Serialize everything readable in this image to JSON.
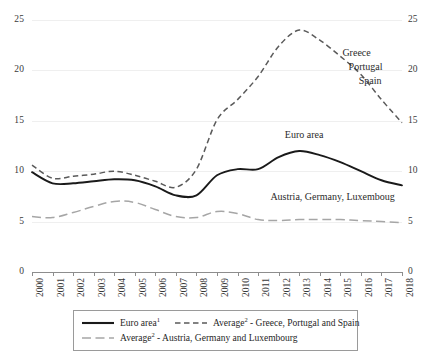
{
  "chart_data": {
    "type": "line",
    "title": "",
    "subtitle": "",
    "xlabel": "",
    "ylabel": "",
    "xlim": [
      2000,
      2018
    ],
    "ylim": [
      0,
      25
    ],
    "yticks": [
      0,
      5,
      10,
      15,
      20,
      25
    ],
    "ytick_labels_left": [
      "0",
      "5",
      "10",
      "15",
      "20",
      "25"
    ],
    "ytick_labels_right": [
      "0",
      "5",
      "10",
      "15",
      "20",
      "25"
    ],
    "grid": "horizontal",
    "legend_position": "bottom",
    "dual_y_axis": true,
    "x": [
      2000,
      2001,
      2002,
      2003,
      2004,
      2005,
      2006,
      2007,
      2008,
      2009,
      2010,
      2011,
      2012,
      2013,
      2014,
      2015,
      2016,
      2017,
      2018
    ],
    "categories": [
      "2000",
      "2001",
      "2002",
      "2003",
      "2004",
      "2005",
      "2006",
      "2007",
      "2008",
      "2009",
      "2010",
      "2011",
      "2012",
      "2013",
      "2014",
      "2015",
      "2016",
      "2017",
      "2018"
    ],
    "series": [
      {
        "name": "Euro area",
        "style": "solid",
        "color": "#1a1a1a",
        "values": [
          9.9,
          8.8,
          8.8,
          9.0,
          9.2,
          9.1,
          8.5,
          7.6,
          7.6,
          9.6,
          10.2,
          10.2,
          11.4,
          12.0,
          11.6,
          10.9,
          10.0,
          9.1,
          8.6
        ]
      },
      {
        "name": "Average - Greece, Portugal and Spain",
        "style": "dashed",
        "color": "#5a5a5a",
        "values": [
          10.6,
          9.3,
          9.5,
          9.7,
          10.0,
          9.6,
          9.0,
          8.4,
          10.2,
          15.1,
          17.1,
          19.4,
          22.4,
          24.0,
          23.0,
          21.4,
          19.6,
          17.1,
          14.8
        ]
      },
      {
        "name": "Average - Austria, Germany and Luxembourg",
        "style": "long-dashed",
        "color": "#a6a6a6",
        "values": [
          5.5,
          5.4,
          5.9,
          6.5,
          7.0,
          6.9,
          6.2,
          5.5,
          5.4,
          6.0,
          5.8,
          5.2,
          5.1,
          5.2,
          5.2,
          5.2,
          5.1,
          5.0,
          4.9
        ]
      }
    ],
    "annotations": [
      {
        "text": "Greece",
        "x": 2015.1,
        "y": 21.7
      },
      {
        "text": "Portugal",
        "x": 2015.4,
        "y": 20.3
      },
      {
        "text": "Spain",
        "x": 2015.9,
        "y": 19.0
      },
      {
        "text": "Euro area",
        "x": 2012.3,
        "y": 13.6
      },
      {
        "text": "Austria, Germany, Luxemboug",
        "x": 2011.6,
        "y": 7.4
      }
    ],
    "legend": [
      {
        "label": "Euro area",
        "sup": "1",
        "style": "solid",
        "color": "#1a1a1a"
      },
      {
        "label": "Average",
        "sup": "2",
        "suffix": " - Greece, Portugal and Spain",
        "style": "dashed",
        "color": "#5a5a5a"
      },
      {
        "label": "Average",
        "sup": "2",
        "suffix": " - Austria, Germany and Luxembourg",
        "style": "long-dashed",
        "color": "#a6a6a6"
      }
    ]
  }
}
